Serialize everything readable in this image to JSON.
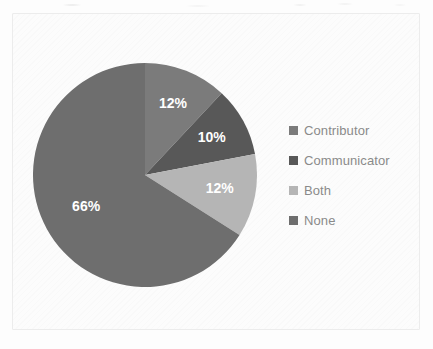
{
  "chart_data": {
    "type": "pie",
    "title": "",
    "subtitle": "",
    "xlabel": "",
    "ylabel": "",
    "grid": false,
    "legend_position": "right",
    "start_angle_deg": 0,
    "direction": "clockwise",
    "categories": [
      "Contributor",
      "Communicator",
      "Both",
      "None"
    ],
    "values": [
      12,
      10,
      12,
      66
    ],
    "value_unit": "%",
    "data_labels": [
      "12%",
      "10%",
      "12%",
      "66%"
    ],
    "slice_colors": [
      "#7b7b7b",
      "#585858",
      "#b5b5b5",
      "#6e6e6e"
    ],
    "data_label_color": "#ffffff"
  },
  "legend": {
    "items": [
      {
        "label": "Contributor",
        "color": "#7b7b7b",
        "swatch_name": "legend-swatch-contributor"
      },
      {
        "label": "Communicator",
        "color": "#585858",
        "swatch_name": "legend-swatch-communicator"
      },
      {
        "label": "Both",
        "color": "#b5b5b5",
        "swatch_name": "legend-swatch-both"
      },
      {
        "label": "None",
        "color": "#6e6e6e",
        "swatch_name": "legend-swatch-none"
      }
    ]
  },
  "theme": {
    "background": "#fdfdfd",
    "frame_border": "#ececec",
    "legend_text": "#8a8a8a"
  }
}
